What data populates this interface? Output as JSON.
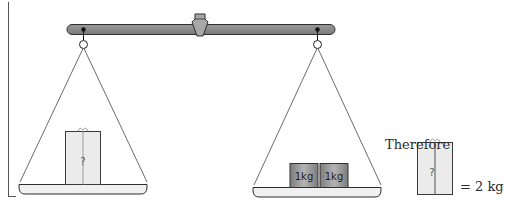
{
  "diagram": {
    "left_pan": {
      "item": "unknown-box",
      "box_label": "?"
    },
    "right_pan": {
      "items": [
        {
          "type": "weight",
          "label": "1kg"
        },
        {
          "type": "weight",
          "label": "1kg"
        }
      ]
    },
    "conclusion": {
      "heading": "Therefore",
      "box_label": "?",
      "result": "= 2 kg"
    },
    "colors": {
      "beam": "#8a8a8a",
      "beam_outline": "#2e2e2e",
      "pan_fill": "#f0f0f0",
      "box_fill": "#ebebeb",
      "weight_fill": "#9a9a9a",
      "line": "#444444"
    }
  }
}
